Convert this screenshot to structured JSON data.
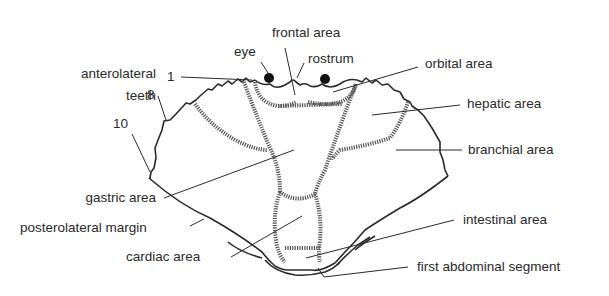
{
  "diagram": {
    "labels": {
      "anterolateral_teeth_line1": "anterolateral",
      "anterolateral_teeth_line2": "teeth",
      "tooth_1": "1",
      "tooth_8": "8",
      "tooth_10": "10",
      "eye": "eye",
      "frontal_area": "frontal area",
      "rostrum": "rostrum",
      "orbital_area": "orbital area",
      "hepatic_area": "hepatic area",
      "branchial_area": "branchial area",
      "gastric_area": "gastric area",
      "posterolateral_margin": "posterolateral margin",
      "cardiac_area": "cardiac area",
      "intestinal_area": "intestinal area",
      "first_abdominal_segment": "first abdominal segment"
    },
    "colors": {
      "ink": "#2a2a2a",
      "background": "#ffffff",
      "groove": "#555555"
    }
  }
}
